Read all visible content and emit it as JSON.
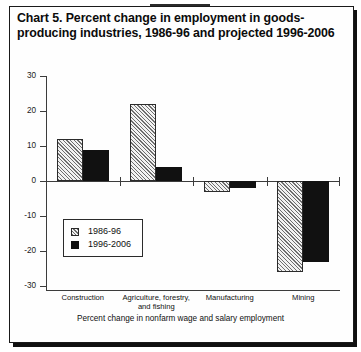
{
  "figure": {
    "title": "Chart 5. Percent change in employment in goods-producing industries, 1986-96 and projected 1996-2006",
    "caption": "Percent change in nonfarm wage and salary employment"
  },
  "chart_data": {
    "type": "bar",
    "title": "Chart 5. Percent change in employment in goods-producing industries, 1986-96 and projected 1996-2006",
    "xlabel": "Percent change in nonfarm wage and salary employment",
    "ylabel": "",
    "ylim": [
      -30,
      30
    ],
    "yticks": [
      30,
      20,
      10,
      0,
      -10,
      -20,
      -30
    ],
    "ytick_labels": [
      "30",
      "20",
      "10",
      "0",
      "-10",
      "-20",
      "-30"
    ],
    "grid": false,
    "legend_position": "inside-lower-left",
    "categories": [
      "Construction",
      "Agriculture, forestry,\nand fishing",
      "Manufacturing",
      "Mining"
    ],
    "series": [
      {
        "name": "1986-96",
        "fill": "hatched",
        "color": "#f2f2f2",
        "values": [
          12,
          22,
          -3,
          -26
        ]
      },
      {
        "name": "1996-2006",
        "fill": "solid",
        "color": "#111111",
        "values": [
          9,
          4,
          -2,
          -23
        ]
      }
    ]
  }
}
